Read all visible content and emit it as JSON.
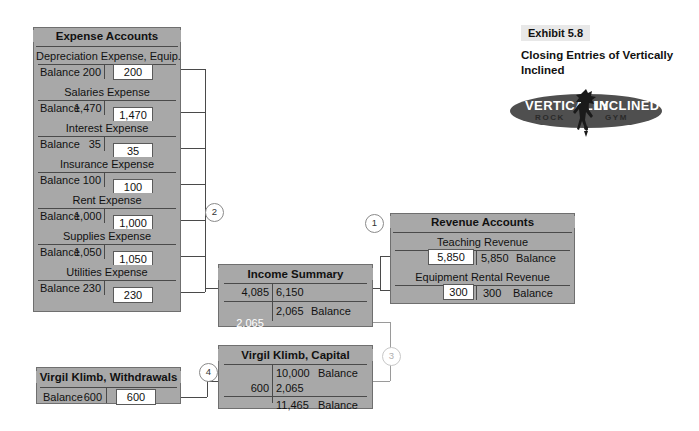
{
  "exhibit": {
    "label": "Exhibit 5.8",
    "caption": "Closing Entries of Vertically Inclined",
    "logo": {
      "name": "vertically-inclined-rock-gym-logo",
      "word_left": "VERTICALLY",
      "word_right": "INCLINED",
      "sub_left": "ROCK",
      "sub_right": "GYM"
    }
  },
  "steps": {
    "one": "1",
    "two": "2",
    "three": "3",
    "four": "4"
  },
  "expense_panel": {
    "title": "Expense Accounts",
    "accounts": [
      {
        "name": "Depreciation Expense, Equip.",
        "balance_label": "Balance",
        "balance": "200",
        "closing": "200"
      },
      {
        "name": "Salaries Expense",
        "balance_label": "Balance",
        "balance": "1,470",
        "closing": "1,470"
      },
      {
        "name": "Interest Expense",
        "balance_label": "Balance",
        "balance": "35",
        "closing": "35"
      },
      {
        "name": "Insurance Expense",
        "balance_label": "Balance",
        "balance": "100",
        "closing": "100"
      },
      {
        "name": "Rent Expense",
        "balance_label": "Balance",
        "balance": "1,000",
        "closing": "1,000"
      },
      {
        "name": "Supplies Expense",
        "balance_label": "Balance",
        "balance": "1,050",
        "closing": "1,050"
      },
      {
        "name": "Utilities Expense",
        "balance_label": "Balance",
        "balance": "230",
        "closing": "230"
      }
    ]
  },
  "revenue_panel": {
    "title": "Revenue Accounts",
    "accounts": [
      {
        "name": "Teaching Revenue",
        "closing": "5,850",
        "balance": "5,850",
        "balance_label": "Balance"
      },
      {
        "name": "Equipment Rental Revenue",
        "closing": "300",
        "balance": "300",
        "balance_label": "Balance"
      }
    ]
  },
  "income_summary": {
    "name": "Income Summary",
    "debit": "4,085",
    "credit": "6,150",
    "balance": "2,065",
    "balance_label": "Balance",
    "closing": "2,065"
  },
  "capital": {
    "name": "Virgil Klimb, Capital",
    "beginning_balance": "10,000",
    "beginning_balance_label": "Balance",
    "debit": "600",
    "credit": "2,065",
    "ending_balance": "11,465",
    "ending_balance_label": "Balance"
  },
  "withdrawals": {
    "name": "Virgil Klimb, Withdrawals",
    "balance_label": "Balance",
    "balance": "600",
    "closing": "600"
  },
  "colors": {
    "panel_grey": "#a8a8a8",
    "rule_dark": "#4a4a4a",
    "line_grey": "#808080",
    "highlight_white": "#ffffff"
  }
}
